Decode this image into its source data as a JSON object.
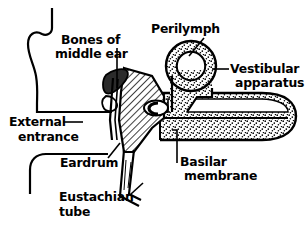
{
  "figure": {
    "background_color": "#ffffff",
    "line_color": "#000000",
    "text_color": "#000000"
  },
  "labels": {
    "bones_of_middle_ear_line1": "Bones of",
    "bones_of_middle_ear_line2": "middle ear",
    "perilymph": "Perilymph",
    "vestibular_apparatus_line1": "Vestibular",
    "vestibular_apparatus_line2": "apparatus",
    "external_entrance_line1": "External",
    "external_entrance_line2": "entrance",
    "eardrum": "Eardrum",
    "eustachian_tube_line1": "Eustachian",
    "eustachian_tube_line2": "tube",
    "basilar_membrane_line1": "Basilar",
    "basilar_membrane_line2": "membrane"
  },
  "structures": {
    "pinna": "outer-ear-pinna",
    "ear_canal": "external-auditory-canal",
    "eardrum": "tympanic-membrane",
    "ossicles": "middle-ear-bones",
    "middle_ear_cavity": "hatched-tympanic-cavity",
    "oval_window": "oval-window-stapes",
    "vestibular_ring": "vestibular-apparatus-ring",
    "cochlea": "stippled-cochlear-duct",
    "basilar_membrane": "basilar-membrane-line",
    "eustachian_tube": "eustachian-tube-channel"
  },
  "fills": {
    "hatch": "diagonal-hatch",
    "stipple": "dotted-stipple",
    "solid_dark": "#2b2b2b"
  }
}
